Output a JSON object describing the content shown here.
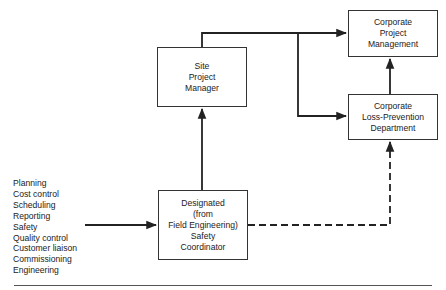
{
  "diagram": {
    "nodes": {
      "site_pm": {
        "lines": [
          "Site",
          "Project",
          "Manager"
        ]
      },
      "corp_pm": {
        "lines": [
          "Corporate",
          "Project",
          "Management"
        ]
      },
      "corp_lpd": {
        "lines": [
          "Corporate",
          "Loss-Prevention",
          "Department"
        ]
      },
      "safety_coord": {
        "lines": [
          "Designated",
          "(from",
          "Field Engineering)",
          "Safety",
          "Coordinator"
        ]
      }
    },
    "responsibilities": [
      "Planning",
      "Cost control",
      "Scheduling",
      "Reporting",
      "Safety",
      "Quality control",
      "Customer liaison",
      "Commissioning",
      "Engineering"
    ],
    "edges": [
      {
        "from": "responsibilities",
        "to": "safety_coord",
        "style": "solid"
      },
      {
        "from": "safety_coord",
        "to": "site_pm",
        "style": "solid"
      },
      {
        "from": "site_pm",
        "to": "corp_pm",
        "style": "solid"
      },
      {
        "from": "site_pm",
        "to": "corp_lpd",
        "style": "solid"
      },
      {
        "from": "corp_lpd",
        "to": "corp_pm",
        "style": "solid"
      },
      {
        "from": "safety_coord",
        "to": "corp_lpd",
        "style": "dashed"
      }
    ]
  }
}
